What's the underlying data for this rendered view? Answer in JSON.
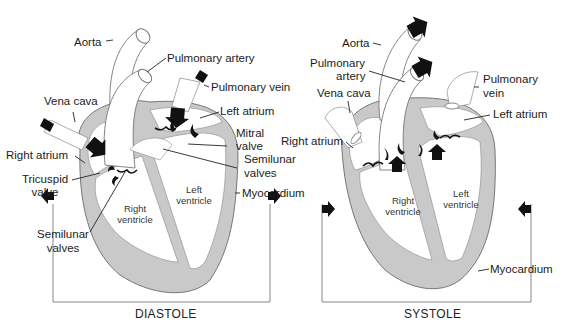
{
  "figure": {
    "panels": [
      {
        "title": "DIASTOLE",
        "labels": {
          "aorta": "Aorta",
          "pulmonary_artery": "Pulmonary artery",
          "pulmonary_vein": "Pulmonary vein",
          "vena_cava": "Vena cava",
          "left_atrium": "Left atrium",
          "mitral_valve_1": "Mitral",
          "mitral_valve_2": "valve",
          "right_atrium": "Right atrium",
          "semilunar_right_1": "Semilunar",
          "semilunar_right_2": "valves",
          "tricuspid_1": "Tricuspid",
          "tricuspid_2": "valve",
          "myocardium": "Myocardium",
          "semilunar_left_1": "Semilunar",
          "semilunar_left_2": "valves",
          "right_ventricle_1": "Right",
          "right_ventricle_2": "ventricle",
          "left_ventricle_1": "Left",
          "left_ventricle_2": "ventricle"
        }
      },
      {
        "title": "SYSTOLE",
        "labels": {
          "aorta": "Aorta",
          "pulmonary_artery_1": "Pulmonary",
          "pulmonary_artery_2": "artery",
          "vena_cava": "Vena cava",
          "pulmonary_vein_1": "Pulmonary",
          "pulmonary_vein_2": "vein",
          "left_atrium": "Left atrium",
          "right_atrium": "Right atrium",
          "right_ventricle_1": "Right",
          "right_ventricle_2": "ventricle",
          "left_ventricle_1": "Left",
          "left_ventricle_2": "ventricle",
          "myocardium": "Myocardium"
        }
      }
    ],
    "colors": {
      "myocardium_fill": "#c9c9c9",
      "outline": "#6a6a6a",
      "arrow": "#111111",
      "leader_line": "#222222"
    }
  }
}
